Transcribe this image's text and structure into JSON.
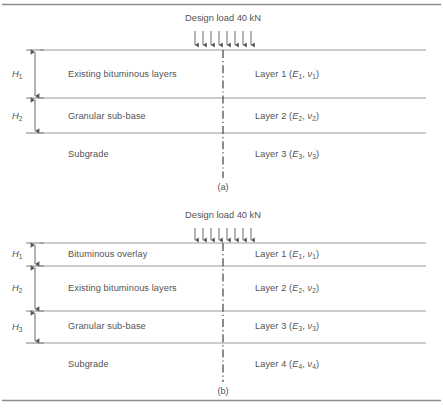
{
  "figure": {
    "border_color": "#8a8a8a",
    "line_color": "#9a9a9a",
    "text_color": "#555253",
    "arrow_color": "#58585a"
  },
  "diagrams": [
    {
      "id": "a",
      "caption": "(a)",
      "load_title": "Design load 40 kN",
      "arrow_count": 8,
      "dimensions": [
        {
          "label": "H",
          "sub": "1"
        },
        {
          "label": "H",
          "sub": "2"
        }
      ],
      "layers": [
        {
          "name": "Existing bituminous layers",
          "layer_text_prefix": "Layer 1 (",
          "modulus": "E",
          "modulus_sub": "1",
          "poisson": "ν",
          "poisson_sub": "1",
          "layer_text_suffix": ")"
        },
        {
          "name": "Granular sub-base",
          "layer_text_prefix": "Layer 2 (",
          "modulus": "E",
          "modulus_sub": "2",
          "poisson": "ν",
          "poisson_sub": "2",
          "layer_text_suffix": ")"
        },
        {
          "name": "Subgrade",
          "layer_text_prefix": "Layer 3 (",
          "modulus": "E",
          "modulus_sub": "3",
          "poisson": "ν",
          "poisson_sub": "3",
          "layer_text_suffix": ")"
        }
      ]
    },
    {
      "id": "b",
      "caption": "(b)",
      "load_title": "Design load 40 kN",
      "arrow_count": 8,
      "dimensions": [
        {
          "label": "H",
          "sub": "1"
        },
        {
          "label": "H",
          "sub": "2"
        },
        {
          "label": "H",
          "sub": "3"
        }
      ],
      "layers": [
        {
          "name": "Bituminous overlay",
          "layer_text_prefix": "Layer 1 (",
          "modulus": "E",
          "modulus_sub": "1",
          "poisson": "ν",
          "poisson_sub": "1",
          "layer_text_suffix": ")"
        },
        {
          "name": "Existing bituminous layers",
          "layer_text_prefix": "Layer 2 (",
          "modulus": "E",
          "modulus_sub": "2",
          "poisson": "ν",
          "poisson_sub": "2",
          "layer_text_suffix": ")"
        },
        {
          "name": "Granular sub-base",
          "layer_text_prefix": "Layer 3 (",
          "modulus": "E",
          "modulus_sub": "3",
          "poisson": "ν",
          "poisson_sub": "3",
          "layer_text_suffix": ")"
        },
        {
          "name": "Subgrade",
          "layer_text_prefix": "Layer 4 (",
          "modulus": "E",
          "modulus_sub": "4",
          "poisson": "ν",
          "poisson_sub": "4",
          "layer_text_suffix": ")"
        }
      ]
    }
  ]
}
